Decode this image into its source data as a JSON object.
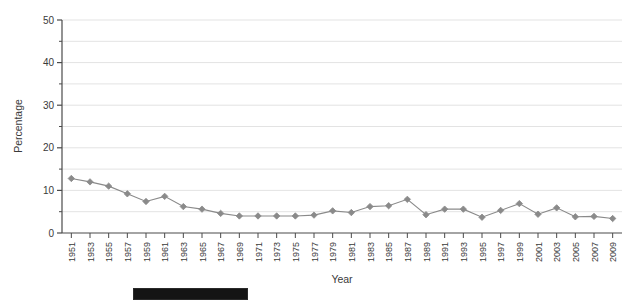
{
  "chart_data": {
    "type": "line",
    "title": "",
    "xlabel": "Year",
    "ylabel": "Percentage",
    "ylim": [
      0,
      50
    ],
    "yticks": [
      0,
      10,
      20,
      30,
      40,
      50
    ],
    "yticks_minor": [
      5,
      15,
      25,
      35,
      45
    ],
    "grid": "horizontal",
    "legend": "none",
    "marker": "diamond",
    "series_color": "#8a8a8a",
    "categories": [
      "1951",
      "1953",
      "1955",
      "1957",
      "1959",
      "1961",
      "1963",
      "1965",
      "1967",
      "1969",
      "1971",
      "1973",
      "1975",
      "1977",
      "1979",
      "1981",
      "1983",
      "1985",
      "1987",
      "1989",
      "1991",
      "1993",
      "1995",
      "1997",
      "1999",
      "2001",
      "2003",
      "2005",
      "2007",
      "2009"
    ],
    "values": [
      12.8,
      12.0,
      11.0,
      9.2,
      7.4,
      8.6,
      6.2,
      5.6,
      4.6,
      4.0,
      4.0,
      4.0,
      4.0,
      4.2,
      5.2,
      4.8,
      6.2,
      6.4,
      7.9,
      4.3,
      5.6,
      5.6,
      3.7,
      5.3,
      6.9,
      4.4,
      5.9,
      3.8,
      3.9,
      3.4
    ],
    "series": [
      {
        "name": "Percentage",
        "values": [
          12.8,
          12.0,
          11.0,
          9.2,
          7.4,
          8.6,
          6.2,
          5.6,
          4.6,
          4.0,
          4.0,
          4.0,
          4.0,
          4.2,
          5.2,
          4.8,
          6.2,
          6.4,
          7.9,
          4.3,
          5.6,
          5.6,
          3.7,
          5.3,
          6.9,
          4.4,
          5.9,
          3.8,
          3.9,
          3.4
        ]
      }
    ]
  },
  "colors": {
    "series": "#8a8a8a",
    "axis": "#4a4a4a",
    "grid": "#e3e3e3",
    "text": "#3a3a3a",
    "redaction": "#141414"
  },
  "annotations": {
    "redaction_bar_label": "redaction-bar"
  }
}
